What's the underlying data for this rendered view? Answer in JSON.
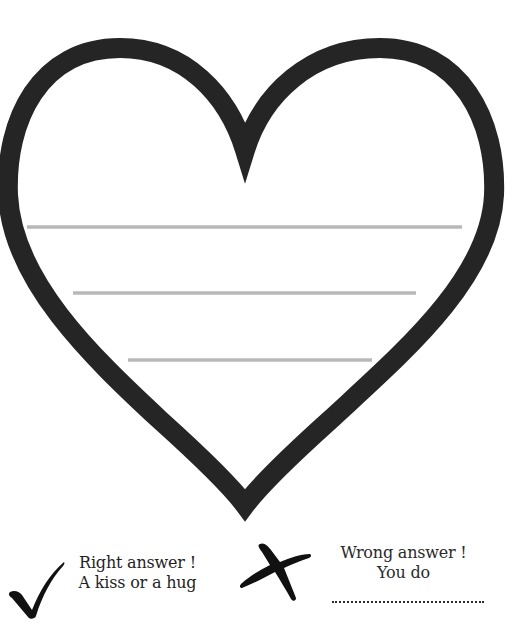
{
  "worksheet": {
    "heart": {
      "stroke_color": "#252525",
      "fill_color": "#ffffff",
      "writing_lines": [
        {
          "x1": 27,
          "x2": 462,
          "y": 227
        },
        {
          "x1": 73,
          "x2": 416,
          "y": 293
        },
        {
          "x1": 128,
          "x2": 372,
          "y": 360
        }
      ],
      "line_color": "#b8b8b8"
    },
    "legend": {
      "right": {
        "icon": "checkmark-icon",
        "line1": "Right answer !",
        "line2": "A kiss or a hug"
      },
      "wrong": {
        "icon": "cross-icon",
        "line1": "Wrong answer !",
        "line2": "You do",
        "blank": ".................................."
      }
    }
  }
}
